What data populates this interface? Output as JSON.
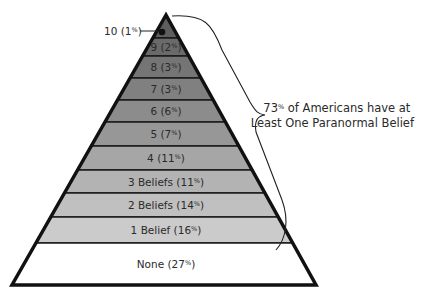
{
  "annotation": {
    "line1": "73% of Americans have at",
    "line2": "Least One Paranormal Belief"
  },
  "layers": [
    {
      "label": "10 (1%)",
      "count": "10",
      "percent": 1,
      "fill": "#5e5e5e"
    },
    {
      "label": "9 (2%)",
      "count": "9",
      "percent": 2,
      "fill": "#6a6a6a"
    },
    {
      "label": "8 (3%)",
      "count": "8",
      "percent": 3,
      "fill": "#757575"
    },
    {
      "label": "7 (3%)",
      "count": "7",
      "percent": 3,
      "fill": "#808080"
    },
    {
      "label": "6 (6%)",
      "count": "6",
      "percent": 6,
      "fill": "#8c8c8c"
    },
    {
      "label": "5 (7%)",
      "count": "5",
      "percent": 7,
      "fill": "#979797"
    },
    {
      "label": "4 (11%)",
      "count": "4",
      "percent": 11,
      "fill": "#a6a6a6"
    },
    {
      "label": "3 Beliefs (11%)",
      "count": "3 Beliefs",
      "percent": 11,
      "fill": "#b3b3b3"
    },
    {
      "label": "2 Beliefs (14%)",
      "count": "2 Beliefs",
      "percent": 14,
      "fill": "#c0c0c0"
    },
    {
      "label": "1 Belief (16%)",
      "count": "1 Belief",
      "percent": 16,
      "fill": "#cbcbcb"
    },
    {
      "label": "None (27%)",
      "count": "None",
      "percent": 27,
      "fill": "#ffffff"
    }
  ],
  "chart_data": {
    "type": "pyramid",
    "title": "",
    "categories": [
      "10",
      "9",
      "8",
      "7",
      "6",
      "5",
      "4",
      "3 Beliefs",
      "2 Beliefs",
      "1 Belief",
      "None"
    ],
    "values": [
      1,
      2,
      3,
      3,
      6,
      7,
      11,
      11,
      14,
      16,
      27
    ],
    "unit": "%",
    "annotation": "73% of Americans have at Least One Paranormal Belief"
  }
}
